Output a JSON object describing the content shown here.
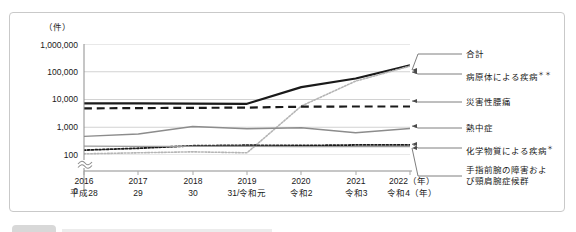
{
  "figure": {
    "unit_label": "（件）",
    "zero_label": "0"
  },
  "chart_data": {
    "type": "line",
    "title": "",
    "xlabel": "",
    "ylabel": "（件）",
    "yscale": "log",
    "ylim": [
      100,
      1000000
    ],
    "grid": true,
    "axis_break": true,
    "legend_position": "right-leader-lines",
    "ytick_labels": [
      "1,000,000",
      "100,000",
      "10,000",
      "1,000",
      "100"
    ],
    "ytick_values": [
      1000000,
      100000,
      10000,
      1000,
      100
    ],
    "categories": [
      "2016",
      "2017",
      "2018",
      "2019",
      "2020",
      "2021",
      "2022"
    ],
    "category_sub": [
      "平成28",
      "29",
      "30",
      "31/令和元",
      "令和2",
      "令和3",
      "令和4（年）"
    ],
    "year_suffix": "（年）",
    "series": [
      {
        "name": "合計",
        "style": "solid",
        "color": "#1a1a1a",
        "width": 2.2,
        "values": [
          7300,
          7200,
          7100,
          7000,
          28000,
          57000,
          170000
        ]
      },
      {
        "name": "病原体による疾病",
        "sup": "＊＊",
        "style": "dotted",
        "color": "#b5b5b5",
        "width": 1.6,
        "values": [
          110,
          120,
          130,
          120,
          5800,
          46000,
          160000
        ]
      },
      {
        "name": "災害性腰痛",
        "style": "dashed",
        "color": "#1a1a1a",
        "width": 2.2,
        "values": [
          4800,
          4900,
          5000,
          5100,
          5500,
          5600,
          5600
        ]
      },
      {
        "name": "熱中症",
        "style": "solid",
        "color": "#8c8c8c",
        "width": 1.4,
        "values": [
          470,
          570,
          1060,
          880,
          960,
          630,
          900
        ]
      },
      {
        "name": "化学物質による疾病",
        "sup": "＊",
        "style": "dotted",
        "color": "#1a1a1a",
        "width": 1.8,
        "values": [
          150,
          175,
          215,
          225,
          220,
          230,
          230
        ]
      },
      {
        "name": "手指前腕の障害および頸肩腕症候群",
        "name_line1": "手指前腕の障害およ",
        "name_line2": "び頸肩腕症候群",
        "style": "solid",
        "color": "#9a9a9a",
        "width": 1.2,
        "values": [
          210,
          205,
          205,
          205,
          200,
          200,
          200
        ]
      }
    ]
  }
}
